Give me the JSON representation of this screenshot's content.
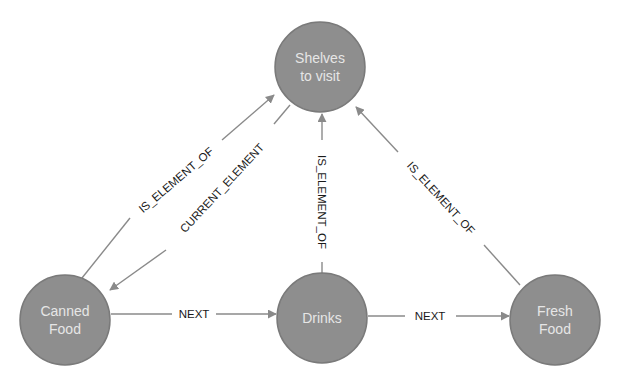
{
  "diagram": {
    "type": "graph",
    "colors": {
      "node_fill": "#8e8e8e",
      "node_text": "#e6e6e6",
      "edge": "#8a8a8a",
      "edge_text": "#1a1a1a",
      "background": "#ffffff"
    },
    "nodes": [
      {
        "id": "shelves",
        "label_lines": [
          "Shelves",
          "to visit"
        ],
        "cx": 320,
        "cy": 67,
        "r": 45
      },
      {
        "id": "canned",
        "label_lines": [
          "Canned",
          "Food"
        ],
        "cx": 65,
        "cy": 320,
        "r": 45
      },
      {
        "id": "drinks",
        "label_lines": [
          "Drinks"
        ],
        "cx": 322,
        "cy": 318,
        "r": 45
      },
      {
        "id": "fresh",
        "label_lines": [
          "Fresh",
          "Food"
        ],
        "cx": 555,
        "cy": 320,
        "r": 45
      }
    ],
    "edges": [
      {
        "id": "canned-is-element-of-shelves",
        "from": "canned",
        "to": "shelves",
        "label": "IS_ELEMENT_OF"
      },
      {
        "id": "shelves-current-element-canned",
        "from": "shelves",
        "to": "canned",
        "label": "CURRENT_ELEMENT"
      },
      {
        "id": "drinks-is-element-of-shelves",
        "from": "drinks",
        "to": "shelves",
        "label": "IS_ELEMENT_OF"
      },
      {
        "id": "fresh-is-element-of-shelves",
        "from": "fresh",
        "to": "shelves",
        "label": "IS_ELEMENT_OF"
      },
      {
        "id": "canned-next-drinks",
        "from": "canned",
        "to": "drinks",
        "label": "NEXT"
      },
      {
        "id": "drinks-next-fresh",
        "from": "drinks",
        "to": "fresh",
        "label": "NEXT"
      }
    ]
  }
}
